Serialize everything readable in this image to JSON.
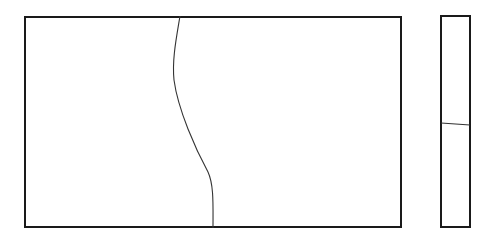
{
  "diagram": {
    "main_panel": {
      "x": 24,
      "y": 16,
      "width": 378,
      "height": 212
    },
    "side_panel": {
      "x": 440,
      "y": 15,
      "width": 31,
      "height": 213
    },
    "main_divider_curve": "M180,16 C176,40 172,60 174,80 C178,110 196,150 208,172 C214,185 213,205 213,228",
    "side_divider_line": {
      "x1": 441,
      "y1": 123,
      "x2": 470,
      "y2": 125
    },
    "stroke_color": "#1a1a1a",
    "curve_color": "#333333"
  }
}
